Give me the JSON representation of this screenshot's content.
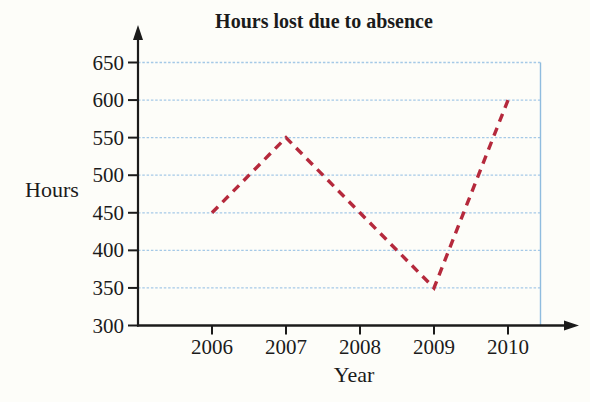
{
  "chart": {
    "title": "Hours lost due to absence",
    "y_axis_label": "Hours",
    "x_axis_label": "Year"
  },
  "chart_data": {
    "type": "line",
    "categories": [
      "2006",
      "2007",
      "2008",
      "2009",
      "2010"
    ],
    "series": [
      {
        "name": "Hours lost due to absence",
        "values": [
          450,
          550,
          450,
          350,
          600
        ]
      }
    ],
    "title": "Hours lost due to absence",
    "xlabel": "Year",
    "ylabel": "Hours",
    "ylim": [
      300,
      650
    ],
    "yticks": [
      300,
      350,
      400,
      450,
      500,
      550,
      600,
      650
    ],
    "grid": true,
    "legend": "none",
    "line_style": "dashed",
    "colors": {
      "line": "#b5293c",
      "grid": "#a5c9e7",
      "plot_border": "#8fbcdf",
      "axis": "#1b1b1b",
      "background": "#fdfdf9"
    }
  }
}
